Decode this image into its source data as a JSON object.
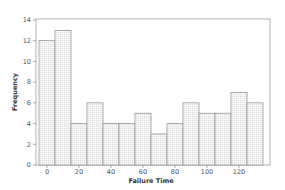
{
  "chart_data": {
    "type": "bar",
    "subtype": "histogram",
    "title": "",
    "xlabel": "Failure Time",
    "ylabel": "Frequency",
    "bin_width": 10,
    "categories": [
      "0",
      "10",
      "20",
      "30",
      "40",
      "50",
      "60",
      "70",
      "80",
      "90",
      "100",
      "110",
      "120",
      "130"
    ],
    "bin_centers": [
      0,
      10,
      20,
      30,
      40,
      50,
      60,
      70,
      80,
      90,
      100,
      110,
      120,
      130
    ],
    "values": [
      12,
      13,
      4,
      6,
      4,
      4,
      5,
      3,
      4,
      6,
      5,
      5,
      7,
      6
    ],
    "xlim": [
      -7,
      140
    ],
    "ylim": [
      0,
      14
    ],
    "x_ticks": [
      0,
      20,
      40,
      60,
      80,
      100,
      120
    ],
    "y_ticks": [
      0,
      2,
      4,
      6,
      8,
      10,
      12,
      14
    ],
    "grid": false,
    "legend": null,
    "colors": {
      "bar_fill": "#f4f4f4",
      "bar_stroke": "#8a8a8a",
      "frame": "#9a9a9a"
    }
  }
}
